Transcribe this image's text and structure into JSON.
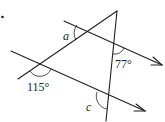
{
  "diagram": {
    "type": "geometry-parallel-lines-transversals",
    "marker": "•",
    "labels": {
      "angle_a": "a",
      "angle_77": "77°",
      "angle_115": "115°",
      "angle_c": "c"
    },
    "colors": {
      "stroke": "#231f20",
      "background": "#ffffff"
    }
  }
}
